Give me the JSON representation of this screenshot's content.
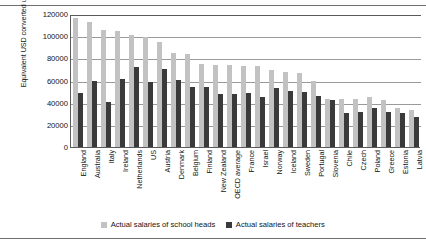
{
  "chart_data": {
    "type": "bar",
    "title": "",
    "xlabel": "",
    "ylabel": "Equivalent USD converted using PPPs",
    "ylim": [
      0,
      120000
    ],
    "yticks": [
      120000,
      100000,
      80000,
      60000,
      40000,
      20000,
      0
    ],
    "ytick_labels": [
      "120000",
      "100000",
      "80000",
      "60000",
      "40000",
      "20000",
      "0"
    ],
    "grid": true,
    "legend_position": "bottom",
    "categories": [
      "England",
      "Australia",
      "Italy",
      "Ireland",
      "Netherlands",
      "US",
      "Austria",
      "Denmark",
      "Belgium",
      "Finland",
      "New Zealand",
      "OECD average",
      "France",
      "Israel",
      "Norway",
      "Iceland",
      "Sweden",
      "Portugal",
      "Slovenia",
      "Chile",
      "Czech",
      "Poland",
      "Greece",
      "Estonia",
      "Latvia"
    ],
    "series": [
      {
        "name": "Actual salaries of school heads",
        "color": "#c2c2c2",
        "values": [
          116000,
          112500,
          106000,
          104500,
          101000,
          99000,
          95000,
          85000,
          83500,
          75000,
          74000,
          74000,
          73500,
          73000,
          69500,
          67500,
          67000,
          60000,
          43000,
          43000,
          43000,
          45000,
          42500,
          35500,
          33500
        ]
      },
      {
        "name": "Actual salaries of teachers",
        "color": "#3a3a3a",
        "values": [
          49000,
          60000,
          41000,
          61500,
          72500,
          58500,
          70500,
          60500,
          54500,
          54000,
          48000,
          47500,
          48500,
          45500,
          53500,
          50500,
          50000,
          46000,
          42000,
          31000,
          31500,
          35500,
          31500,
          30500,
          27500
        ]
      }
    ]
  },
  "legend": {
    "items": [
      {
        "label": "Actual salaries of school heads",
        "color": "#c2c2c2"
      },
      {
        "label": "Actual salaries of teachers",
        "color": "#3a3a3a"
      }
    ]
  }
}
